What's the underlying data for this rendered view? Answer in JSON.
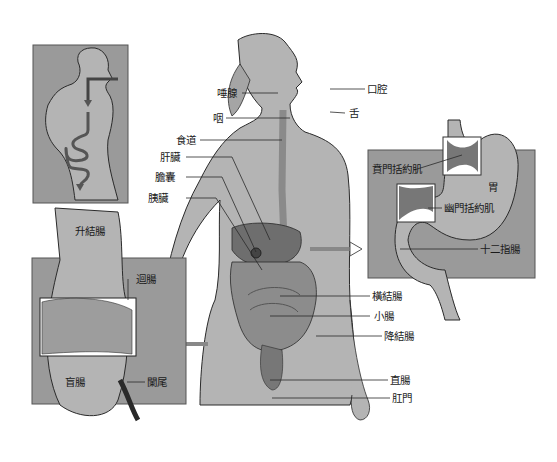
{
  "diagram": {
    "colors": {
      "background": "#ffffff",
      "panel": "#9a9a9a",
      "body": "#b4b4b4",
      "organ": "#6e6e6e",
      "organ_light": "#8c8c8c",
      "line": "#2a2a2a"
    },
    "labels": {
      "salivary_gland": "唾腺",
      "oral_cavity": "口腔",
      "pharynx": "咽",
      "tongue": "舌",
      "esophagus": "食道",
      "liver": "肝臟",
      "gallbladder": "膽囊",
      "pancreas": "胰臟",
      "transverse_colon": "橫結腸",
      "small_intestine": "小腸",
      "descending_colon": "降結腸",
      "rectum": "直腸",
      "anus": "肛門",
      "cardiac_sphincter": "賁門括約肌",
      "stomach": "胃",
      "pyloric_sphincter": "幽門括約肌",
      "duodenum": "十二指腸",
      "ascending_colon": "升結腸",
      "ileum": "迴腸",
      "cecum": "盲腸",
      "appendix": "闌尾"
    },
    "insets": [
      {
        "name": "digestive-path-overview"
      },
      {
        "name": "stomach-detail"
      },
      {
        "name": "cecum-detail"
      }
    ]
  }
}
